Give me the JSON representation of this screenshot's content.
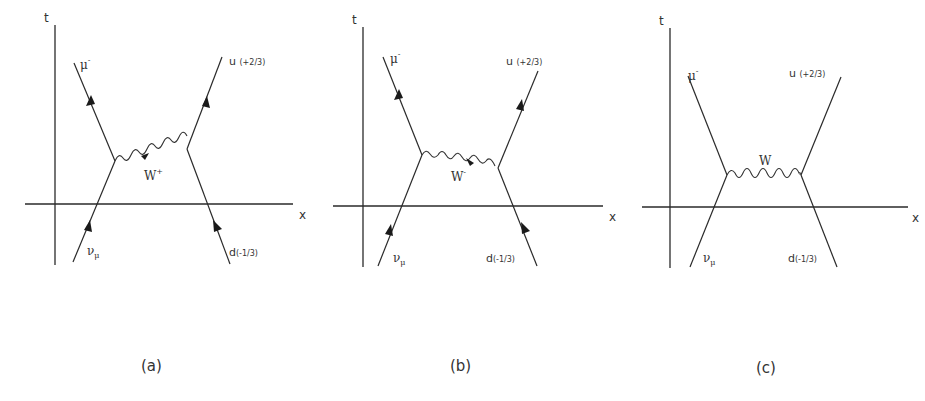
{
  "figure": {
    "panels": [
      {
        "id": "a",
        "caption": "(a)",
        "axes": {
          "t_label": "t",
          "x_label": "x"
        },
        "particles": {
          "mu": {
            "symbol": "μ",
            "charge": "-"
          },
          "nu": {
            "symbol": "ν",
            "sub": "μ"
          },
          "u": {
            "label": "u",
            "charge": "(+2/3)"
          },
          "d": {
            "label": "d",
            "charge": "(-1/3)"
          }
        },
        "boson": {
          "symbol": "W",
          "charge": "+"
        },
        "has_arrows": true
      },
      {
        "id": "b",
        "caption": "(b)",
        "axes": {
          "t_label": "t",
          "x_label": "x"
        },
        "particles": {
          "mu": {
            "symbol": "μ",
            "charge": "-"
          },
          "nu": {
            "symbol": "ν",
            "sub": "μ"
          },
          "u": {
            "label": "u",
            "charge": "(+2/3)"
          },
          "d": {
            "label": "d",
            "charge": "(-1/3)"
          }
        },
        "boson": {
          "symbol": "W",
          "charge": "-"
        },
        "has_arrows": true
      },
      {
        "id": "c",
        "caption": "(c)",
        "axes": {
          "t_label": "t",
          "x_label": "x"
        },
        "particles": {
          "mu": {
            "symbol": "μ",
            "charge": "-"
          },
          "nu": {
            "symbol": "ν",
            "sub": "μ"
          },
          "u": {
            "label": "u",
            "charge": "(+2/3)"
          },
          "d": {
            "label": "d",
            "charge": "(-1/3)"
          }
        },
        "boson": {
          "symbol": "W",
          "charge": ""
        },
        "has_arrows": false
      }
    ]
  }
}
